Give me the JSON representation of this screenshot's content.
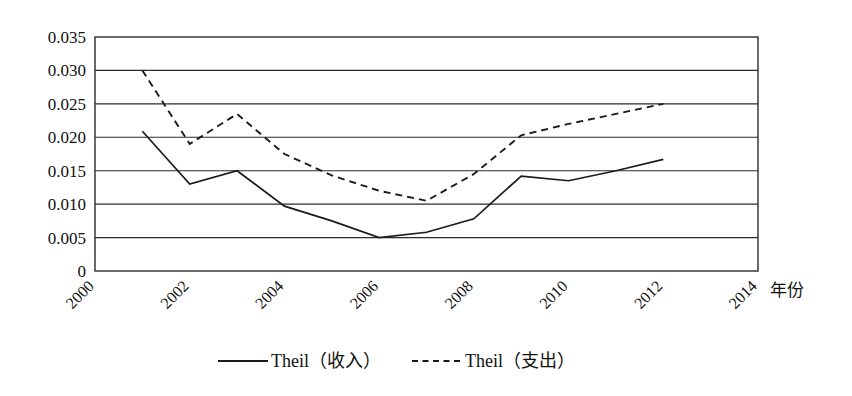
{
  "chart_data": {
    "type": "line",
    "title": "",
    "xlabel": "年份",
    "ylabel": "",
    "x": [
      2001,
      2002,
      2003,
      2004,
      2005,
      2006,
      2007,
      2008,
      2009,
      2010,
      2011,
      2012
    ],
    "xlim": [
      2000,
      2014
    ],
    "ylim": [
      0,
      0.035
    ],
    "grid": "horizontal",
    "legend_position": "bottom-center",
    "xtick_labels": [
      "2000",
      "2002",
      "2004",
      "2006",
      "2008",
      "2010",
      "2012",
      "2014"
    ],
    "xtick_values": [
      2000,
      2002,
      2004,
      2006,
      2008,
      2010,
      2012,
      2014
    ],
    "xtick_rotation": 45,
    "ytick_labels": [
      "0",
      "0.005",
      "0.010",
      "0.015",
      "0.020",
      "0.025",
      "0.030",
      "0.035"
    ],
    "ytick_values": [
      0,
      0.005,
      0.01,
      0.015,
      0.02,
      0.025,
      0.03,
      0.035
    ],
    "series": [
      {
        "name": "Theil（收入）",
        "style": "solid",
        "color": "#1b1b1b",
        "x": [
          2001,
          2002,
          2003,
          2004,
          2005,
          2006,
          2007,
          2008,
          2009,
          2010,
          2011,
          2012
        ],
        "values": [
          0.0209,
          0.013,
          0.015,
          0.0097,
          0.0075,
          0.005,
          0.0058,
          0.0078,
          0.0142,
          0.0135,
          0.015,
          0.0167
        ]
      },
      {
        "name": "Theil（支出）",
        "style": "dashed",
        "color": "#1b1b1b",
        "x": [
          2001,
          2002,
          2003,
          2004,
          2005,
          2006,
          2007,
          2008,
          2009,
          2010,
          2011,
          2012
        ],
        "values": [
          0.03,
          0.019,
          0.0235,
          0.0175,
          0.0143,
          0.012,
          0.0105,
          0.0145,
          0.0203,
          0.022,
          0.0235,
          0.025
        ]
      }
    ]
  },
  "legend": {
    "items": [
      {
        "label": "Theil（收入）",
        "style": "solid"
      },
      {
        "label": "Theil（支出）",
        "style": "dashed"
      }
    ]
  },
  "axis": {
    "x_title": "年份"
  }
}
